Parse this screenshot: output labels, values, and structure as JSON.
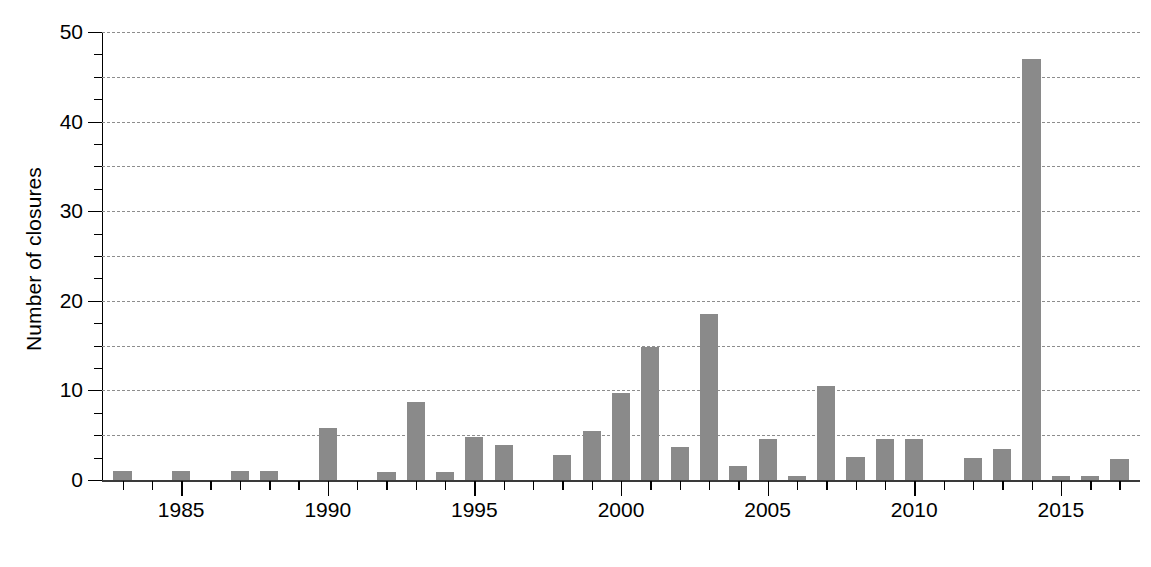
{
  "chart_data": {
    "type": "bar",
    "title": "",
    "xlabel": "",
    "ylabel": "Number of closures",
    "ylim": [
      0,
      50
    ],
    "xlim": [
      1982.3,
      2017.7
    ],
    "ytick_major": [
      0,
      10,
      20,
      30,
      40,
      50
    ],
    "ytick_minor": [
      5,
      15,
      25,
      35,
      45
    ],
    "ytick_labels": [
      "0",
      "10",
      "20",
      "30",
      "40",
      "50"
    ],
    "grid": "horizontal-dashed-every-5",
    "legend": "none",
    "bar_color": "#8a8a8a",
    "xtick_major_labels": [
      "1985",
      "1990",
      "1995",
      "2000",
      "2005",
      "2010",
      "2015"
    ],
    "xtick_major_values": [
      1985,
      1990,
      1995,
      2000,
      2005,
      2010,
      2015
    ],
    "categories": [
      1983,
      1984,
      1985,
      1986,
      1987,
      1988,
      1989,
      1990,
      1991,
      1992,
      1993,
      1994,
      1995,
      1996,
      1997,
      1998,
      1999,
      2000,
      2001,
      2002,
      2003,
      2004,
      2005,
      2006,
      2007,
      2008,
      2009,
      2010,
      2011,
      2012,
      2013,
      2014,
      2015,
      2016,
      2017
    ],
    "values": [
      1.0,
      0,
      1.0,
      0,
      1.0,
      1.0,
      0,
      5.8,
      0,
      0.9,
      8.7,
      0.9,
      4.8,
      3.9,
      0,
      2.8,
      5.5,
      9.7,
      14.8,
      3.7,
      18.5,
      1.6,
      4.6,
      0.5,
      10.5,
      2.6,
      4.6,
      4.6,
      0,
      2.5,
      3.5,
      47.0,
      0.5,
      0.5,
      2.4
    ]
  },
  "caption": {
    "text": ""
  }
}
